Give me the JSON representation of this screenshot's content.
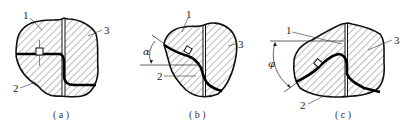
{
  "figure": {
    "panels": [
      {
        "id": "a",
        "caption": "( a )",
        "labels": {
          "part1": "1",
          "part2": "2",
          "part3": "3"
        },
        "angle_symbol": ""
      },
      {
        "id": "b",
        "caption": "( b )",
        "labels": {
          "part1": "1",
          "part2": "2",
          "part3": "3"
        },
        "angle_symbol": "α"
      },
      {
        "id": "c",
        "caption": "( c )",
        "labels": {
          "part1": "1",
          "part2": "2",
          "part3": "3"
        },
        "angle_symbol": "φ"
      }
    ],
    "colors": {
      "outline": "#111111",
      "hatch": "#555555",
      "interface": "#000000",
      "background": "#ffffff"
    }
  }
}
